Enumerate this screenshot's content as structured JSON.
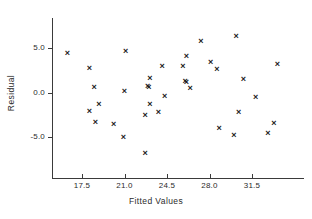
{
  "chart_data": {
    "type": "scatter",
    "title": "",
    "xlabel": "Fitted Values",
    "ylabel": "Residual",
    "xlim": [
      15.2,
      34.2
    ],
    "ylim": [
      -8.6,
      7.5
    ],
    "xticks": [
      17.5,
      21.0,
      24.5,
      28.0,
      31.5
    ],
    "xtick_labels": [
      "17.5",
      "21.0",
      "24.5",
      "28.0",
      "31.5"
    ],
    "yticks": [
      5.0,
      0.0,
      -5.0
    ],
    "ytick_labels": [
      "5.0",
      "0.0",
      "-5.0"
    ],
    "grid": false,
    "legend": null,
    "marker": "x",
    "marker_color": "#1a1a1a",
    "points": [
      {
        "x": 16.3,
        "y": 4.4
      },
      {
        "x": 18.1,
        "y": 2.7
      },
      {
        "x": 18.5,
        "y": 0.6
      },
      {
        "x": 18.9,
        "y": -1.4
      },
      {
        "x": 18.1,
        "y": -2.1
      },
      {
        "x": 18.6,
        "y": -3.4
      },
      {
        "x": 20.1,
        "y": -3.6
      },
      {
        "x": 21.1,
        "y": 4.6
      },
      {
        "x": 21.0,
        "y": 0.1
      },
      {
        "x": 20.9,
        "y": -5.0
      },
      {
        "x": 23.1,
        "y": 1.6
      },
      {
        "x": 22.9,
        "y": 0.7
      },
      {
        "x": 23.0,
        "y": 0.6
      },
      {
        "x": 24.1,
        "y": 2.9
      },
      {
        "x": 23.1,
        "y": -1.4
      },
      {
        "x": 24.3,
        "y": -0.5
      },
      {
        "x": 22.7,
        "y": -2.6
      },
      {
        "x": 23.8,
        "y": -2.3
      },
      {
        "x": 22.7,
        "y": -6.8
      },
      {
        "x": 25.8,
        "y": 2.9
      },
      {
        "x": 26.1,
        "y": 4.1
      },
      {
        "x": 26.0,
        "y": 1.2
      },
      {
        "x": 26.1,
        "y": 1.1
      },
      {
        "x": 26.4,
        "y": 0.5
      },
      {
        "x": 27.3,
        "y": 5.7
      },
      {
        "x": 28.1,
        "y": 3.4
      },
      {
        "x": 28.6,
        "y": 2.6
      },
      {
        "x": 28.8,
        "y": -4.1
      },
      {
        "x": 30.2,
        "y": 6.3
      },
      {
        "x": 30.8,
        "y": 1.5
      },
      {
        "x": 30.4,
        "y": -2.3
      },
      {
        "x": 30.0,
        "y": -4.8
      },
      {
        "x": 31.8,
        "y": -0.6
      },
      {
        "x": 32.8,
        "y": -4.6
      },
      {
        "x": 33.3,
        "y": -3.5
      },
      {
        "x": 33.6,
        "y": 3.1
      }
    ]
  }
}
